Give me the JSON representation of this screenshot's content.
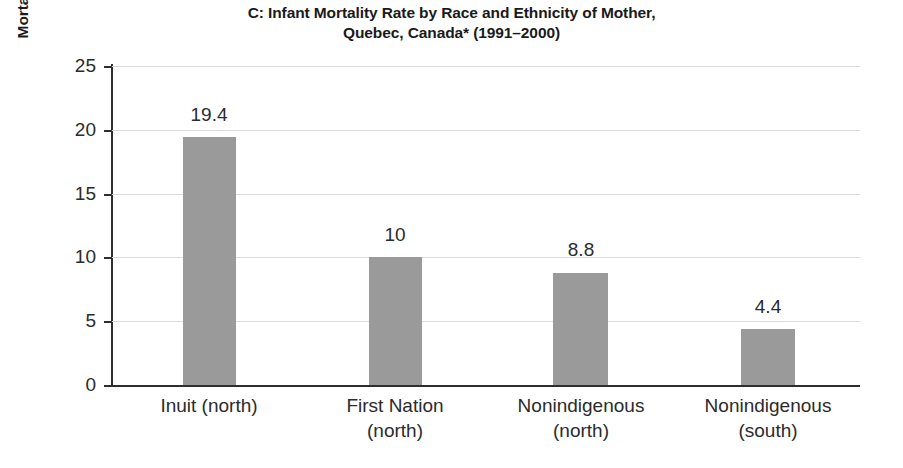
{
  "chart_data": {
    "type": "bar",
    "title": "C: Infant Mortality Rate by Race and Ethnicity of Mother, Quebec, Canada* (1991–2000)",
    "title_lines": [
      "C: Infant Mortality Rate by Race and Ethnicity of Mother,",
      "Quebec, Canada* (1991–2000)"
    ],
    "xlabel": "",
    "ylabel": "Mortality Rate per 1,000 Live Births",
    "categories": [
      "Inuit (north)",
      "First Nation (north)",
      "Nonindigenous (north)",
      "Nonindigenous (south)"
    ],
    "category_lines": [
      [
        "Inuit (north)"
      ],
      [
        "First Nation",
        "(north)"
      ],
      [
        "Nonindigenous",
        "(north)"
      ],
      [
        "Nonindigenous",
        "(south)"
      ]
    ],
    "values": [
      19.4,
      10,
      8.8,
      4.4
    ],
    "value_labels": [
      "19.4",
      "10",
      "8.8",
      "4.4"
    ],
    "ylim": [
      0,
      25
    ],
    "yticks": [
      0,
      5,
      10,
      15,
      20,
      25
    ],
    "ytick_labels": [
      "0",
      "5",
      "10",
      "15",
      "20",
      "25"
    ],
    "grid": true,
    "legend": false,
    "bar_color": "#9a9a9a",
    "gridline_color": "#dadada",
    "axis_color": "#2e2e2e",
    "text_color": "#2b2b2b"
  }
}
